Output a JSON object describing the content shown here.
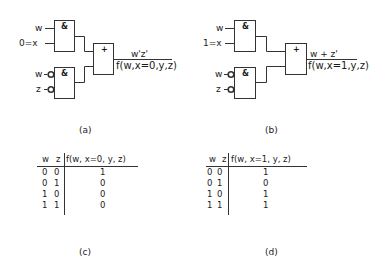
{
  "figure": {
    "panels": [
      {
        "id": "a",
        "caption": "(a)",
        "inputs": {
          "and1_a": "w",
          "and1_b": "0=x",
          "and2_a": "w",
          "and2_b": "z"
        },
        "and_symbol": "&",
        "or_symbol": "+",
        "output_expr": "w'z'",
        "output_label": "f(w,x=0,y,z)"
      },
      {
        "id": "b",
        "caption": "(b)",
        "inputs": {
          "and1_a": "w",
          "and1_b": "1=x",
          "and2_a": "w",
          "and2_b": "z"
        },
        "and_symbol": "&",
        "or_symbol": "+",
        "output_expr": "w + z'",
        "output_label": "f(w,x=1,y,z)"
      }
    ],
    "tables": [
      {
        "id": "c",
        "caption": "(c)",
        "headers": [
          "w",
          "z",
          "f(w, x=0, y, z)"
        ],
        "rows": [
          [
            "0",
            "0",
            "1"
          ],
          [
            "0",
            "1",
            "0"
          ],
          [
            "1",
            "0",
            "0"
          ],
          [
            "1",
            "1",
            "0"
          ]
        ]
      },
      {
        "id": "d",
        "caption": "(d)",
        "headers": [
          "w",
          "z",
          "f(w, x=1, y, z)"
        ],
        "rows": [
          [
            "0",
            "0",
            "1"
          ],
          [
            "0",
            "1",
            "0"
          ],
          [
            "1",
            "0",
            "1"
          ],
          [
            "1",
            "1",
            "1"
          ]
        ]
      }
    ]
  }
}
